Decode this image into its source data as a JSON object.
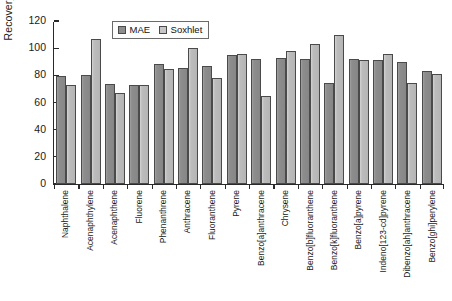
{
  "chart_data": {
    "type": "bar",
    "title": "",
    "xlabel": "",
    "ylabel": "Recovery (%)",
    "ylim": [
      0,
      120
    ],
    "yticks": [
      0,
      20,
      40,
      60,
      80,
      100,
      120
    ],
    "grid": false,
    "legend_position": "top-center",
    "categories": [
      "Naphthalene",
      "Acenaphthylene",
      "Acenaphthene",
      "Fluorene",
      "Phenanthrene",
      "Anthracene",
      "Fluoranthene",
      "Pyrene",
      "Benzo[a]anthracene",
      "Chrysene",
      "Benzo[b]fluoranthene",
      "Benzo[k]fluoranthene",
      "Benzo[a]pyrene",
      "Indeno[123-cd]pyrene",
      "Dibenzo[ah]anthracene",
      "Benzo[ghi]perylene"
    ],
    "series": [
      {
        "name": "MAE",
        "color": "#8d8d8d",
        "values": [
          79.5,
          80,
          73.5,
          73,
          88,
          85.5,
          87,
          95,
          92,
          93,
          92,
          74,
          92,
          91,
          90,
          83
        ]
      },
      {
        "name": "Soxhlet",
        "color": "#bcbcbc",
        "values": [
          73,
          106.5,
          67,
          73,
          85,
          100,
          78,
          96,
          65,
          98,
          103,
          109.5,
          91.5,
          95.5,
          74,
          81
        ]
      }
    ]
  },
  "legend": {
    "items": [
      {
        "label": "MAE",
        "swatch": "mae"
      },
      {
        "label": "Soxhlet",
        "swatch": "sox"
      }
    ]
  }
}
